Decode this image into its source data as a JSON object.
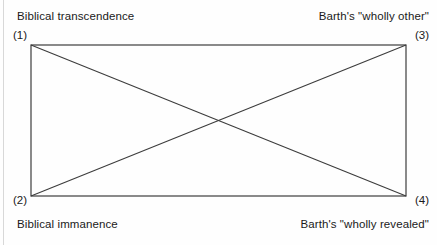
{
  "figure": {
    "type": "quadrant-rectangle-diagram",
    "background_color": "#fefefe",
    "line_color": "#3c3c3c",
    "text_color": "#1a1a1a"
  },
  "rectangle": {
    "left": 31,
    "top": 45,
    "right": 406,
    "bottom": 196,
    "width": 375,
    "height": 151
  },
  "diagonals": {
    "crossing_point": {
      "x": 218,
      "y": 120
    },
    "segments": [
      {
        "name": "diagonal-1-to-4",
        "from": "(1)",
        "to": "(4)"
      },
      {
        "name": "diagonal-2-to-3",
        "from": "(2)",
        "to": "(3)"
      }
    ]
  },
  "corners": {
    "top_left": {
      "number": "(1)",
      "caption": "Biblical transcendence"
    },
    "top_right": {
      "number": "(3)",
      "caption": "Barth's \"wholly other\""
    },
    "bottom_left": {
      "number": "(2)",
      "caption": "Biblical immanence"
    },
    "bottom_right": {
      "number": "(4)",
      "caption": "Barth's \"wholly revealed\""
    }
  }
}
